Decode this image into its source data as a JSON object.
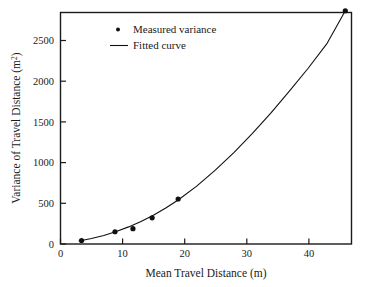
{
  "chart_data": {
    "type": "scatter",
    "title": "",
    "xlabel": "Mean Travel Distance (m)",
    "ylabel_main": "Variance of Travel Distance (m",
    "ylabel_sup": "2",
    "ylabel_tail": ")",
    "ylabel_full": "Variance of Travel Distance (m2)",
    "xlim": [
      0,
      47
    ],
    "ylim": [
      0,
      2650
    ],
    "grid": false,
    "legend_position": "top-center",
    "xticks": [
      0,
      10,
      20,
      30,
      40
    ],
    "xtick_labels": [
      "0",
      "10",
      "20",
      "30",
      "40"
    ],
    "yticks": [
      0,
      500,
      1000,
      1500,
      2000,
      2500
    ],
    "ytick_labels": [
      "0",
      "500",
      "1000",
      "1500",
      "2000",
      "2500"
    ],
    "series": [
      {
        "name": "Measured variance",
        "marker": "filled-circle",
        "color": "#101010",
        "x": [
          3.4,
          8.8,
          11.7,
          14.8,
          19.0,
          46.0
        ],
        "y": [
          40,
          140,
          175,
          300,
          515,
          2670
        ]
      },
      {
        "name": "Fitted curve",
        "marker": "line",
        "color": "#101010",
        "x": [
          3.0,
          5.0,
          7.0,
          9.0,
          11.0,
          13.0,
          15.0,
          17.0,
          19.0,
          22.0,
          25.0,
          28.0,
          31.0,
          34.0,
          37.0,
          40.0,
          43.0,
          46.0
        ],
        "y": [
          35,
          62,
          97,
          142,
          196,
          258,
          330,
          412,
          503,
          662,
          845,
          1047,
          1265,
          1500,
          1752,
          2012,
          2290,
          2670
        ]
      }
    ],
    "legend": [
      {
        "label": "Measured variance",
        "symbol": "dot"
      },
      {
        "label": "Fitted curve",
        "symbol": "line"
      }
    ]
  },
  "colors": {
    "axis": "#1a1a1a",
    "marker": "#101010",
    "curve": "#101010",
    "background": "#ffffff"
  }
}
